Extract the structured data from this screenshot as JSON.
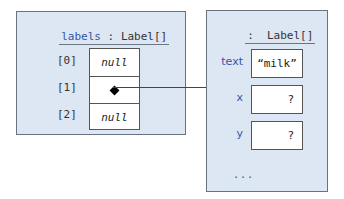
{
  "array_var": {
    "name": "labels",
    "separator": " : ",
    "type": "Label[]",
    "elements": [
      {
        "index": "[0]",
        "value": "null"
      },
      {
        "index": "[1]",
        "value": "reference"
      },
      {
        "index": "[2]",
        "value": "null"
      }
    ]
  },
  "object": {
    "title": ":  Label[]",
    "fields": [
      {
        "name": "text",
        "value": "“milk”"
      },
      {
        "name": "x",
        "value": "?"
      },
      {
        "name": "y",
        "value": "?"
      }
    ],
    "more": "..."
  },
  "colors": {
    "panel_bg": "#dde6f3",
    "label_blue": "#3456a8",
    "border": "#555555"
  }
}
